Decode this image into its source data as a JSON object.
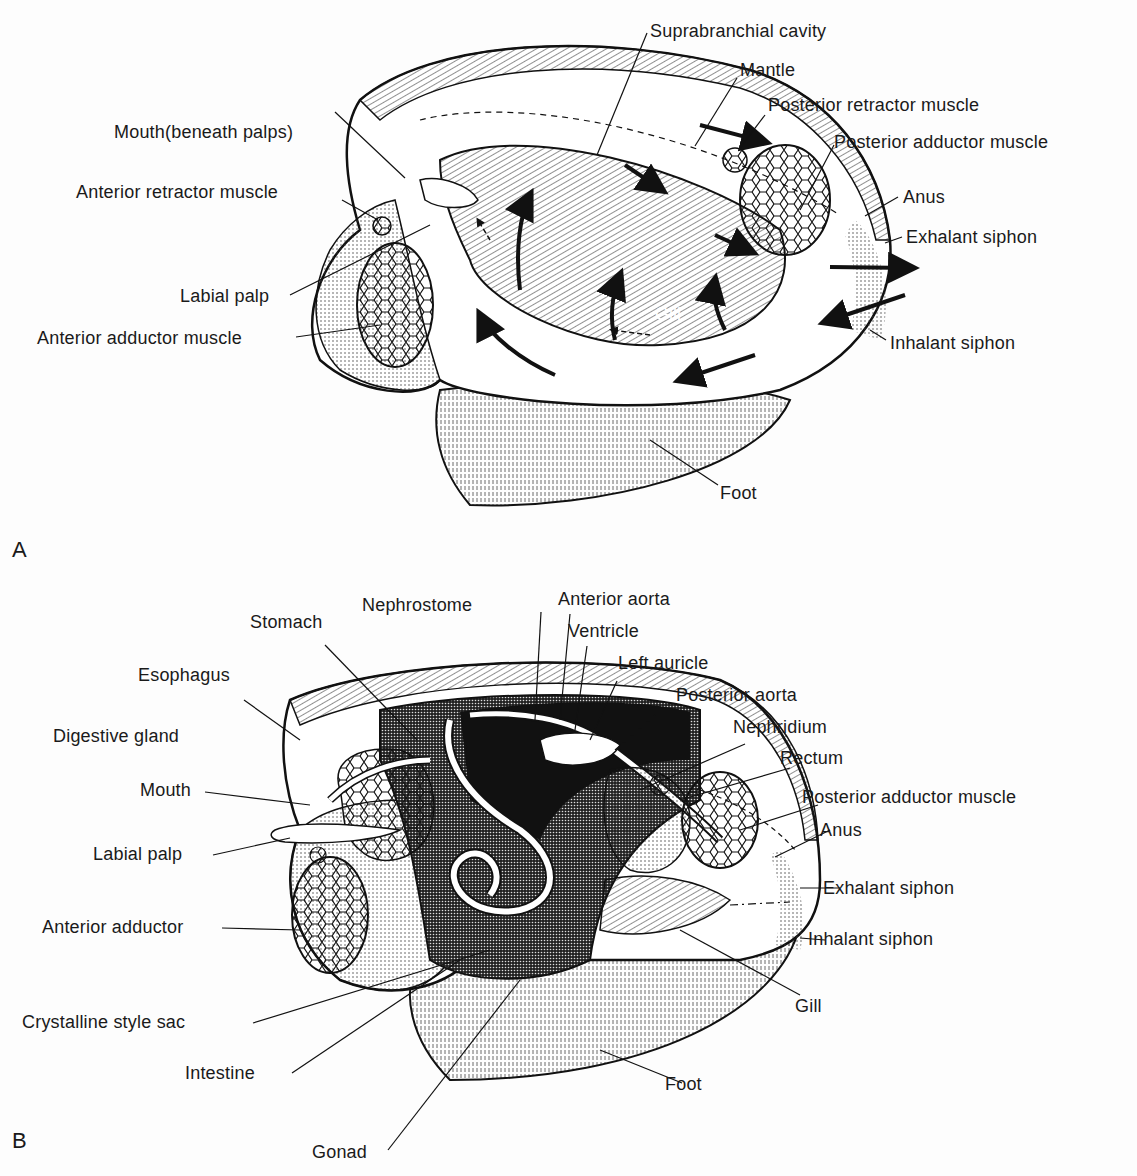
{
  "figure": {
    "panels": [
      {
        "id": "A",
        "letter": "A",
        "labels": {
          "suprabranchial_cavity": "Suprabranchial cavity",
          "mantle": "Mantle",
          "posterior_retractor_muscle": "Posterior retractor muscle",
          "posterior_adductor_muscle": "Posterior adductor muscle",
          "mouth": "Mouth(beneath palps)",
          "anterior_retractor_muscle": "Anterior retractor muscle",
          "anus": "Anus",
          "exhalant_siphon": "Exhalant siphon",
          "labial_palp": "Labial palp",
          "anterior_adductor_muscle": "Anterior adductor muscle",
          "gill": "Gill",
          "inhalant_siphon": "Inhalant siphon",
          "foot": "Foot"
        }
      },
      {
        "id": "B",
        "letter": "B",
        "labels": {
          "nephrostome": "Nephrostome",
          "anterior_aorta": "Anterior aorta",
          "stomach": "Stomach",
          "ventricle": "Ventricle",
          "left_auricle": "Left auricle",
          "esophagus": "Esophagus",
          "posterior_aorta": "Posterior aorta",
          "digestive_gland": "Digestive gland",
          "nephridium": "Nephridium",
          "rectum": "Rectum",
          "mouth": "Mouth",
          "posterior_adductor_muscle": "Posterior adductor muscle",
          "anus": "Anus",
          "labial_palp": "Labial palp",
          "exhalant_siphon": "Exhalant siphon",
          "anterior_adductor": "Anterior adductor",
          "inhalant_siphon": "Inhalant siphon",
          "gill": "Gill",
          "crystalline_style_sac": "Crystalline style sac",
          "intestine": "Intestine",
          "foot": "Foot",
          "gonad": "Gonad"
        }
      }
    ]
  }
}
